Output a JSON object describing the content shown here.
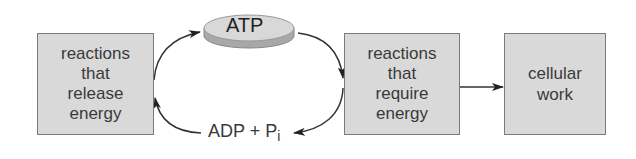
{
  "diagram": {
    "nodes": {
      "release": {
        "lines": [
          "reactions",
          "that",
          "release",
          "energy"
        ]
      },
      "atp": {
        "label": "ATP"
      },
      "require": {
        "lines": [
          "reactions",
          "that",
          "require",
          "energy"
        ]
      },
      "work": {
        "lines": [
          "cellular",
          "work"
        ]
      },
      "adp": {
        "label": "ADP + P",
        "subscript": "i"
      }
    },
    "edges": [
      {
        "from": "reactions that release energy",
        "to": "ATP"
      },
      {
        "from": "ATP",
        "to": "reactions that require energy"
      },
      {
        "from": "reactions that require energy",
        "to": "cellular work"
      },
      {
        "from": "reactions that require energy",
        "to": "ADP + Pi"
      },
      {
        "from": "ADP + Pi",
        "to": "reactions that release energy"
      }
    ],
    "colors": {
      "box_fill": "#d9d9d9",
      "box_border": "#7a7a7a",
      "text": "#3a3a3a",
      "arrow": "#333333",
      "disk_top": "#d8d8d8",
      "disk_side": "#a8a8a8"
    }
  }
}
